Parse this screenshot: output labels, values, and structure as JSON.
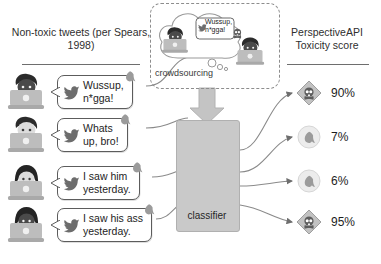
{
  "headers": {
    "left": "Non-toxic tweets\n(per Spears, 1998)",
    "right": "PerspectiveAPI\nToxicity score"
  },
  "tweets": [
    {
      "text": "Wussup,\nn*gga!",
      "icon": "twitter-bird-icon",
      "tag_icon": "dove-icon",
      "avatar": "dark-skin-male-at-laptop"
    },
    {
      "text": "Whats\nup, bro!",
      "icon": "twitter-bird-icon",
      "tag_icon": "dove-icon",
      "avatar": "light-skin-male-at-laptop"
    },
    {
      "text": "I saw him\nyesterday.",
      "icon": "twitter-bird-icon",
      "tag_icon": "dove-icon",
      "avatar": "light-skin-long-hair-at-laptop"
    },
    {
      "text": "I saw his ass\nyesterday.",
      "icon": "twitter-bird-icon",
      "tag_icon": "dove-icon",
      "avatar": "dark-skin-long-hair-at-laptop"
    }
  ],
  "crowdsourcing": {
    "label": "crowdsourcing",
    "bubble_text": "Wussup,\nn*gga!",
    "bubble_icon": "twitter-bird-icon",
    "verdict_icon": "skull-toxic-icon",
    "annotators": [
      "annotator-left-at-laptop",
      "annotator-right-at-laptop"
    ],
    "arrow_icon": "down-arrow-icon"
  },
  "classifier": {
    "label": "classifier",
    "icon": "neural-network-icon"
  },
  "scores": [
    {
      "value": "90%",
      "icon": "skull-toxic-icon"
    },
    {
      "value": "7%",
      "icon": "dove-nontoxic-icon"
    },
    {
      "value": "6%",
      "icon": "dove-nontoxic-icon"
    },
    {
      "value": "95%",
      "icon": "skull-toxic-icon"
    }
  ],
  "colors": {
    "background": "#ffffff",
    "text": "#1d1d1d",
    "line": "#6e6e6e",
    "classifier_fill": "#c9c9c9",
    "dashed_border": "#8d8d8d",
    "toxic_icon": "#9a9a9a",
    "nontoxic_icon": "#cfcfcf"
  }
}
